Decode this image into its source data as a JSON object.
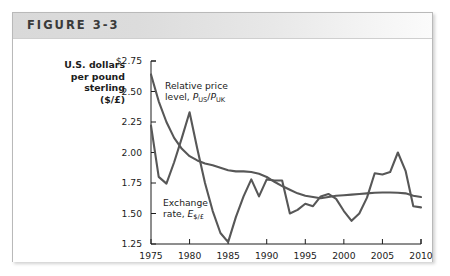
{
  "figure": {
    "title": "FIGURE 3-3",
    "axis_title_lines": [
      "U.S. dollars",
      "per pound",
      "sterling",
      "($/£)"
    ]
  },
  "chart_data": {
    "type": "line",
    "title": "FIGURE 3-3",
    "xlabel": "",
    "ylabel": "U.S. dollars per pound sterling ($/£)",
    "xlim": [
      1975,
      2010
    ],
    "ylim": [
      1.25,
      2.75
    ],
    "grid": false,
    "legend": "in-plot annotations",
    "ytick_labels": [
      "$2.75",
      "2.50",
      "2.25",
      "2.00",
      "1.75",
      "1.50",
      "1.25"
    ],
    "ytick_values": [
      2.75,
      2.5,
      2.25,
      2.0,
      1.75,
      1.5,
      1.25
    ],
    "xtick_labels": [
      "1975",
      "1980",
      "1985",
      "1990",
      "1995",
      "2000",
      "2005",
      "2010"
    ],
    "xtick_values": [
      1975,
      1980,
      1985,
      1990,
      1995,
      2000,
      2005,
      2010
    ],
    "x": [
      1975,
      1976,
      1977,
      1978,
      1979,
      1980,
      1981,
      1982,
      1983,
      1984,
      1985,
      1986,
      1987,
      1988,
      1989,
      1990,
      1991,
      1992,
      1993,
      1994,
      1995,
      1996,
      1997,
      1998,
      1999,
      2000,
      2001,
      2002,
      2003,
      2004,
      2005,
      2006,
      2007,
      2008,
      2009,
      2010
    ],
    "series": [
      {
        "name": "Exchange rate, E$/£",
        "annotation": "Exchange rate, E$/£",
        "color": "#575757",
        "values": [
          2.22,
          1.8,
          1.745,
          1.92,
          2.12,
          2.33,
          2.03,
          1.75,
          1.52,
          1.34,
          1.265,
          1.47,
          1.64,
          1.78,
          1.64,
          1.78,
          1.77,
          1.77,
          1.5,
          1.53,
          1.58,
          1.56,
          1.64,
          1.66,
          1.62,
          1.52,
          1.44,
          1.5,
          1.63,
          1.83,
          1.82,
          1.84,
          2.0,
          1.85,
          1.56,
          1.55
        ]
      },
      {
        "name": "Relative price level, PUS/PUK",
        "annotation": "Relative price level, PUS/PUK",
        "color": "#575757",
        "values": [
          2.64,
          2.42,
          2.25,
          2.12,
          2.03,
          1.97,
          1.935,
          1.91,
          1.895,
          1.875,
          1.855,
          1.845,
          1.845,
          1.84,
          1.825,
          1.8,
          1.76,
          1.725,
          1.695,
          1.665,
          1.645,
          1.635,
          1.625,
          1.635,
          1.645,
          1.65,
          1.655,
          1.66,
          1.665,
          1.67,
          1.672,
          1.672,
          1.67,
          1.665,
          1.645,
          1.635
        ]
      }
    ],
    "annotations": [
      {
        "text_line1": "Relative price",
        "text_line2": "level, PUS/PUK",
        "at": [
          1977.5,
          2.6
        ]
      },
      {
        "text_line1": "Exchange",
        "text_line2": "rate, E$/£",
        "at": [
          1977.0,
          1.61
        ]
      }
    ]
  }
}
